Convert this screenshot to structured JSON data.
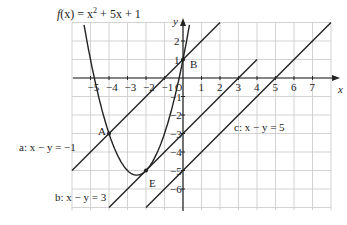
{
  "title": {
    "text_f": "f",
    "text_x": "(x) = x",
    "sup": "2",
    "rest": " + 5x + 1"
  },
  "axes": {
    "x_label": "x",
    "y_label": "y",
    "origin": "O",
    "x_ticks": [
      "-5",
      "-4",
      "-3",
      "-2",
      "-1",
      "1",
      "2",
      "3",
      "4",
      "5",
      "6",
      "7"
    ],
    "y_ticks": [
      "2",
      "1",
      "-1",
      "-2",
      "-3",
      "-4",
      "-5",
      "-6"
    ]
  },
  "points": {
    "A": "A",
    "B": "B",
    "E": "E"
  },
  "lines": {
    "a": "a: x − y = −1",
    "b": "b: x − y = 3",
    "c": "c: x − y = 5"
  },
  "chart_data": {
    "type": "line",
    "xlim": [
      -6,
      8
    ],
    "ylim": [
      -7,
      3
    ],
    "grid": true,
    "series": [
      {
        "name": "f(x) = x² + 5x + 1",
        "kind": "parabola",
        "vertex": [
          -2.5,
          -5.25
        ]
      },
      {
        "name": "a: x − y = −1",
        "kind": "line",
        "equation": "y = x + 1"
      },
      {
        "name": "b: x − y = 3",
        "kind": "line",
        "equation": "y = x − 3"
      },
      {
        "name": "c: x − y = 5",
        "kind": "line",
        "equation": "y = x − 5"
      }
    ],
    "points": [
      {
        "label": "A",
        "x": -4,
        "y": -3
      },
      {
        "label": "B",
        "x": 0,
        "y": 1
      },
      {
        "label": "E",
        "x": -2,
        "y": -5
      }
    ]
  }
}
